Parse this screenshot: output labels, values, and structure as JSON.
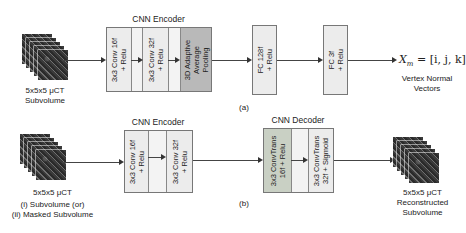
{
  "panel_a": {
    "input": {
      "line1": "5x5x5 μCT",
      "line2": "Subvolume"
    },
    "encoder_title": "CNN Encoder",
    "encoder_blocks": [
      {
        "line1": "3x3 Conv 16f",
        "line2": "+ Relu"
      },
      {
        "line1": "3x3 Conv 32f",
        "line2": "+ Relu"
      },
      {
        "line1": "3D Adaptive",
        "line2": "Average",
        "line3": "Pooling"
      }
    ],
    "fc1": {
      "line1": "FC 128f",
      "line2": "+ Relu"
    },
    "fc2": {
      "line1": "FC 3f",
      "line2": "+ Relu"
    },
    "output_formula": "X_m = [i, j, k]",
    "output_formula_lhs": "X",
    "output_formula_sub": "m",
    "output_formula_rhs": " = [i, j, k]",
    "output": {
      "line1": "Vertex Normal",
      "line2": "Vectors"
    },
    "caption": "(a)"
  },
  "panel_b": {
    "input": {
      "line1": "5x5x5 μCT",
      "line2": "(i) Subvolume (or)",
      "line3": "(ii) Masked Subvolume"
    },
    "encoder_title": "CNN Encoder",
    "encoder_blocks": [
      {
        "line1": "3x3 Conv 16f",
        "line2": "+ Relu"
      },
      {
        "line1": "3x3 Conv 32f",
        "line2": "+ Relu"
      }
    ],
    "decoder_title": "CNN Decoder",
    "decoder_blocks": [
      {
        "line1": "3x3 ConvTrans",
        "line2": "16f + Relu"
      },
      {
        "line1": "3x3 ConvTrans",
        "line2": "32f + Sigmoid"
      }
    ],
    "output": {
      "line1": "5x5x5 μCT",
      "line2": "Reconstructed",
      "line3": "Subvolume"
    },
    "caption": "(b)"
  },
  "colors": {
    "block_light": "#ececec",
    "block_gap": "#f3f3f3",
    "pool_block": "#b9b9b9",
    "decoder_block": "#c9d0c4",
    "border": "#777777",
    "line": "#444444"
  }
}
